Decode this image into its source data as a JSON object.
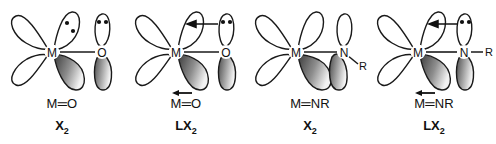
{
  "figure": {
    "background_color": "#ffffff",
    "line_color": "#1a1a1a",
    "lobe_fill_light": "#ffffff",
    "lobe_shade_dark": "#3a3a3a",
    "lobe_shade_light": "#e8e8e8"
  },
  "panels": [
    {
      "id": "panel-mo-x2",
      "metal_label": "M",
      "ligand_label": "O",
      "substituent_label": "",
      "formula": "M═O",
      "formula_plain": "M=O",
      "class_code": "X",
      "class_subscript": "2",
      "donation_arrow": false,
      "formula_arrow": false,
      "lone_pairs": [
        {
          "on": "metal-upper-right-lobe",
          "dots": 2
        },
        {
          "on": "ligand-upper-lobe",
          "dots": 2
        }
      ],
      "shaded_lobes": [
        "metal-lower-right-lobe",
        "ligand-lower-lobe"
      ],
      "open_lobes": [
        "metal-upper-left-lobe",
        "metal-lower-left-lobe",
        "metal-upper-right-lobe",
        "ligand-upper-lobe"
      ]
    },
    {
      "id": "panel-mo-lx2",
      "metal_label": "M",
      "ligand_label": "O",
      "substituent_label": "",
      "formula": "M═O",
      "formula_plain": "M=O",
      "class_code": "LX",
      "class_subscript": "2",
      "donation_arrow": true,
      "donation_arrow_direction": "right-to-left",
      "formula_arrow": true,
      "lone_pairs": [
        {
          "on": "ligand-upper-lobe",
          "dots": 2
        }
      ],
      "shaded_lobes": [
        "metal-lower-right-lobe",
        "ligand-lower-lobe"
      ],
      "open_lobes": [
        "metal-upper-left-lobe",
        "metal-lower-left-lobe",
        "metal-upper-right-lobe",
        "ligand-upper-lobe"
      ]
    },
    {
      "id": "panel-mnr-x2",
      "metal_label": "M",
      "ligand_label": "N",
      "substituent_label": "R",
      "formula": "M═NR",
      "formula_plain": "M=NR",
      "class_code": "X",
      "class_subscript": "2",
      "donation_arrow": false,
      "formula_arrow": false,
      "lone_pairs": [],
      "shaded_lobes": [
        "metal-lower-right-lobe",
        "ligand-lower-lobe"
      ],
      "open_lobes": [
        "metal-upper-left-lobe",
        "metal-lower-left-lobe",
        "metal-upper-right-lobe",
        "ligand-upper-lobe"
      ]
    },
    {
      "id": "panel-mnr-lx2",
      "metal_label": "M",
      "ligand_label": "N",
      "substituent_label": "R",
      "formula": "M═NR",
      "formula_plain": "M=NR",
      "class_code": "LX",
      "class_subscript": "2",
      "donation_arrow": true,
      "donation_arrow_direction": "right-to-left",
      "formula_arrow": true,
      "lone_pairs": [
        {
          "on": "ligand-upper-lobe",
          "dots": 2
        }
      ],
      "shaded_lobes": [
        "metal-lower-right-lobe",
        "ligand-lower-lobe"
      ],
      "open_lobes": [
        "metal-upper-left-lobe",
        "metal-lower-left-lobe",
        "metal-upper-right-lobe",
        "ligand-upper-lobe"
      ]
    }
  ]
}
